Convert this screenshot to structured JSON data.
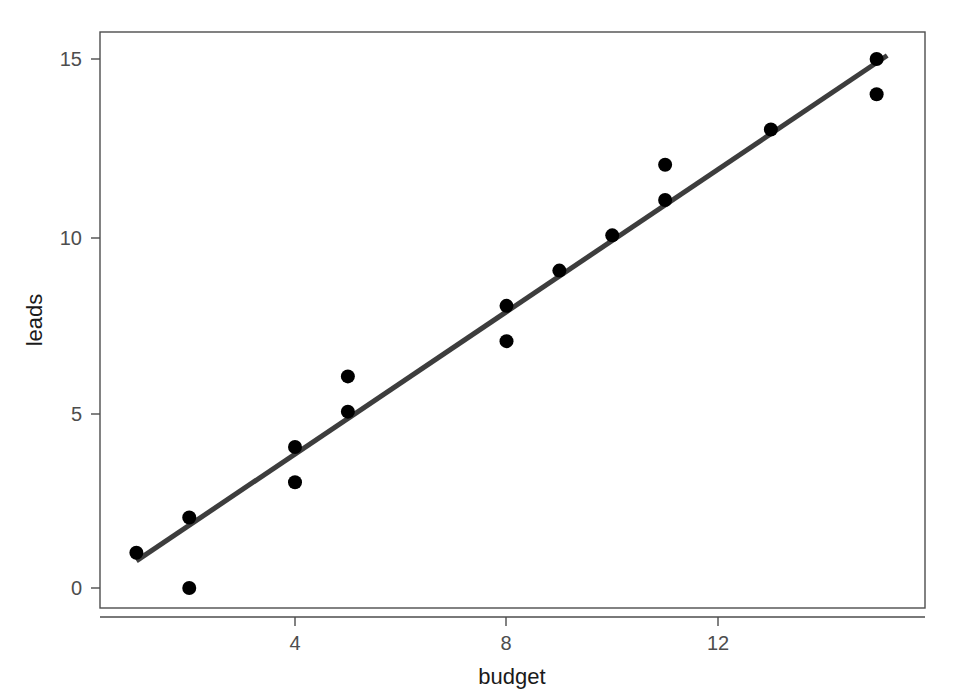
{
  "figure": {
    "background_color": "#ffffff",
    "width": 963,
    "height": 692
  },
  "chart_data": {
    "type": "scatter",
    "title": "",
    "subtitle": "",
    "xlabel": "budget",
    "ylabel": "leads",
    "xlim": [
      0.4,
      15.9
    ],
    "ylim": [
      -0.4,
      15.6
    ],
    "xticks": [
      4,
      8,
      12
    ],
    "xtick_labels": [
      "4",
      "8",
      "12"
    ],
    "yticks": [
      0,
      5,
      10,
      15
    ],
    "ytick_labels": [
      "0",
      "5",
      "10",
      "15"
    ],
    "grid": false,
    "legend": null,
    "legend_position": "none",
    "point_color": "#000000",
    "point_size": 7,
    "series": [
      {
        "name": "observations",
        "type": "scatter",
        "x": [
          1,
          2,
          2,
          4,
          4,
          5,
          5,
          8,
          8,
          9,
          10,
          11,
          11,
          13,
          15,
          15
        ],
        "y": [
          1,
          2,
          0,
          4,
          3,
          6,
          5,
          8,
          7,
          9,
          10,
          11,
          12,
          13,
          15,
          14
        ],
        "points": [
          {
            "budget": 1,
            "leads": 1
          },
          {
            "budget": 2,
            "leads": 2
          },
          {
            "budget": 2,
            "leads": 0
          },
          {
            "budget": 4,
            "leads": 4
          },
          {
            "budget": 4,
            "leads": 3
          },
          {
            "budget": 5,
            "leads": 6
          },
          {
            "budget": 5,
            "leads": 5
          },
          {
            "budget": 8,
            "leads": 8
          },
          {
            "budget": 8,
            "leads": 7
          },
          {
            "budget": 9,
            "leads": 9
          },
          {
            "budget": 10,
            "leads": 10
          },
          {
            "budget": 11,
            "leads": 11
          },
          {
            "budget": 11,
            "leads": 12
          },
          {
            "budget": 13,
            "leads": 13
          },
          {
            "budget": 15,
            "leads": 15
          },
          {
            "budget": 15,
            "leads": 14
          }
        ]
      },
      {
        "name": "regression-line",
        "type": "line",
        "color": "#3d3d3d",
        "line_width": 5,
        "endpoints": [
          {
            "budget": 1.0,
            "leads": 0.77
          },
          {
            "budget": 15.2,
            "leads": 15.1
          }
        ]
      }
    ]
  },
  "axes": {
    "x_axis": {
      "label": "budget",
      "tick_labels": [
        "4",
        "8",
        "12"
      ],
      "tick_values": [
        4,
        8,
        12
      ]
    },
    "y_axis": {
      "label": "leads",
      "tick_labels": [
        "0",
        "5",
        "10",
        "15"
      ],
      "tick_values": [
        0,
        5,
        10,
        15
      ],
      "rotation": -90
    }
  }
}
